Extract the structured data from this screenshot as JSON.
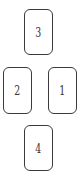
{
  "diagram": {
    "layout": "cross",
    "cards": [
      {
        "position": "top",
        "label": "3"
      },
      {
        "position": "left",
        "label": "2"
      },
      {
        "position": "right",
        "label": "1"
      },
      {
        "position": "bottom",
        "label": "4"
      }
    ]
  },
  "colors": {
    "background": "#ffffff",
    "border": "#3a3a3a",
    "text": "#333333"
  }
}
